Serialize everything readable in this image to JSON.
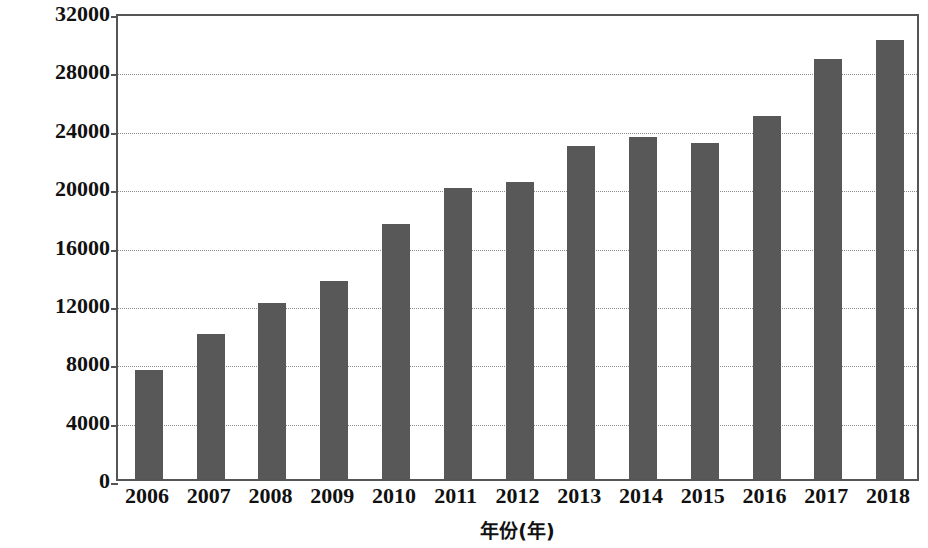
{
  "chart_data": {
    "type": "bar",
    "title": "",
    "xlabel": "年份(年)",
    "ylabel": "货物周转量(亿吨公里)",
    "categories": [
      "2006",
      "2007",
      "2008",
      "2009",
      "2010",
      "2011",
      "2012",
      "2013",
      "2014",
      "2015",
      "2016",
      "2017",
      "2018"
    ],
    "values": [
      7500,
      9960,
      12080,
      13600,
      17500,
      19930,
      20350,
      22840,
      23460,
      23050,
      24860,
      28760,
      30100
    ],
    "series": [
      {
        "name": "货物周转量",
        "values": [
          7500,
          9960,
          12080,
          13600,
          17500,
          19930,
          20350,
          22840,
          23460,
          23050,
          24860,
          28760,
          30100
        ]
      }
    ],
    "ylim": [
      0,
      32000
    ],
    "yticks": [
      0,
      4000,
      8000,
      12000,
      16000,
      20000,
      24000,
      28000,
      32000
    ],
    "ytick_labels": [
      "0",
      "4000",
      "8000",
      "12000",
      "16000",
      "20000",
      "24000",
      "28000",
      "32000"
    ],
    "xtick_labels": [
      "2006",
      "2007",
      "2008",
      "2009",
      "2010",
      "2011",
      "2012",
      "2013",
      "2014",
      "2015",
      "2016",
      "2017",
      "2018"
    ],
    "grid": true,
    "legend": false,
    "legend_position": "none",
    "bar_color": "#585858",
    "axis_color": "#555555",
    "gridline_color": "#8a8a8a",
    "background_color": "#ffffff"
  }
}
